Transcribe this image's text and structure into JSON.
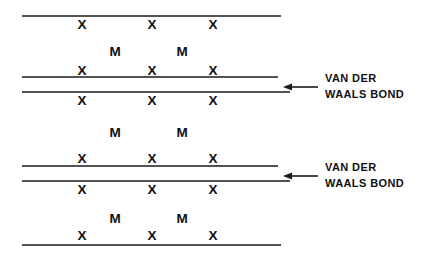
{
  "diagram": {
    "background_color": "#ffffff",
    "line_color": "#1a1a1a",
    "text_color": "#111111",
    "atom_labels": {
      "chalcogen": "X",
      "metal": "M"
    },
    "layer_lines": [
      {
        "id": "line-1",
        "y": 16,
        "x_start": 22,
        "x_end": 281
      },
      {
        "id": "line-2",
        "y": 77,
        "x_start": 22,
        "x_end": 278
      },
      {
        "id": "line-3",
        "y": 92,
        "x_start": 22,
        "x_end": 290
      },
      {
        "id": "line-4",
        "y": 166,
        "x_start": 22,
        "x_end": 278
      },
      {
        "id": "line-5",
        "y": 181,
        "x_start": 22,
        "x_end": 290
      },
      {
        "id": "line-6",
        "y": 245,
        "x_start": 22,
        "x_end": 281
      }
    ],
    "x_atom_columns": [
      82,
      152,
      213
    ],
    "m_atom_columns": [
      115,
      182
    ],
    "x_atom_rows": [
      {
        "id": "x-row-1",
        "y": 25
      },
      {
        "id": "x-row-2",
        "y": 71
      },
      {
        "id": "x-row-3",
        "y": 101
      },
      {
        "id": "x-row-4",
        "y": 159
      },
      {
        "id": "x-row-5",
        "y": 190
      },
      {
        "id": "x-row-6",
        "y": 236
      }
    ],
    "m_atom_rows": [
      {
        "id": "m-row-1",
        "y": 52
      },
      {
        "id": "m-row-2",
        "y": 133
      },
      {
        "id": "m-row-3",
        "y": 219
      }
    ],
    "annotations": [
      {
        "id": "van-der-waals-bond-upper",
        "line_1": "VAN DER",
        "line_2": "WAALS BOND",
        "text_x": 325,
        "text_y": 70,
        "arrow": {
          "tail_x": 318,
          "head_x": 283,
          "y": 87
        }
      },
      {
        "id": "van-der-waals-bond-lower",
        "line_1": "VAN DER",
        "line_2": "WAALS BOND",
        "text_x": 325,
        "text_y": 159,
        "arrow": {
          "tail_x": 318,
          "head_x": 283,
          "y": 176
        }
      }
    ]
  }
}
